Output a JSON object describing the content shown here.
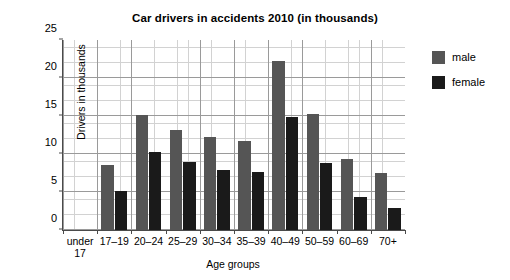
{
  "chart_data": {
    "type": "bar",
    "title": "Car drivers in accidents 2010 (in thousands)",
    "xlabel": "Age groups",
    "ylabel": "Drivers in thousands",
    "categories": [
      "under 17",
      "17–19",
      "20–24",
      "25–29",
      "30–34",
      "35–39",
      "40–49",
      "50–59",
      "60–69",
      "70+"
    ],
    "series": [
      {
        "name": "male",
        "color": "#555555",
        "values": [
          0,
          8.5,
          15.1,
          13.2,
          12.3,
          11.7,
          22.3,
          15.2,
          9.4,
          7.5
        ]
      },
      {
        "name": "female",
        "color": "#1a1a1a",
        "values": [
          0,
          5.1,
          10.2,
          8.9,
          7.9,
          7.6,
          14.9,
          8.8,
          4.4,
          2.9
        ]
      }
    ],
    "ylim": [
      0,
      25
    ],
    "yticks": [
      0,
      5,
      10,
      15,
      20,
      25
    ],
    "ytick_labels": [
      "0",
      "5",
      "10",
      "15",
      "20",
      "25"
    ],
    "grid": true,
    "grid_minor_step": 1,
    "grid_major_step": 5,
    "legend_position": "right"
  },
  "legend": {
    "items": [
      {
        "label": "male"
      },
      {
        "label": "female"
      }
    ]
  }
}
